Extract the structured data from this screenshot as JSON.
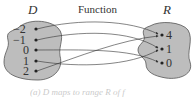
{
  "title": "Function",
  "domain_label": "D",
  "range_label": "R",
  "domain_values": [
    "−2",
    "−1",
    "0",
    "1",
    "2"
  ],
  "range_values": [
    "4",
    "1",
    "0"
  ],
  "mappings": [
    {
      "from": "−2",
      "to": "4"
    },
    {
      "from": "−1",
      "to": "1"
    },
    {
      "from": "0",
      "to": "0"
    },
    {
      "from": "1",
      "to": "1"
    },
    {
      "from": "2",
      "to": "4"
    }
  ],
  "caption": "(a) D maps to range R of f"
}
